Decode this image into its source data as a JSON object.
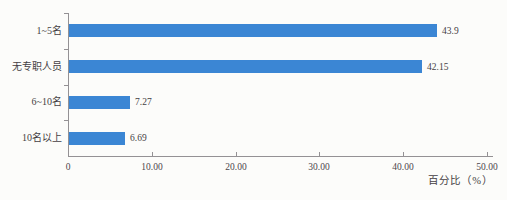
{
  "chart_data": {
    "type": "bar",
    "orientation": "horizontal",
    "title": "",
    "categories": [
      "1~5名",
      "无专职人员",
      "6~10名",
      "10名以上"
    ],
    "values": [
      43.9,
      42.15,
      7.27,
      6.69
    ],
    "value_labels": [
      "43.9",
      "42.15",
      "7.27",
      "6.69"
    ],
    "xlabel": "百分比（%）",
    "ylabel": "",
    "xlim": [
      0,
      50
    ],
    "x_tick_values": [
      0,
      10,
      20,
      30,
      40,
      50
    ],
    "x_tick_labels": [
      "0",
      "10.00",
      "20.00",
      "30.00",
      "40.00",
      "50.00"
    ],
    "grid": false,
    "legend": false,
    "bar_color": "#3b86d4",
    "axis_color": "#949194",
    "text_color": "#453f44"
  }
}
